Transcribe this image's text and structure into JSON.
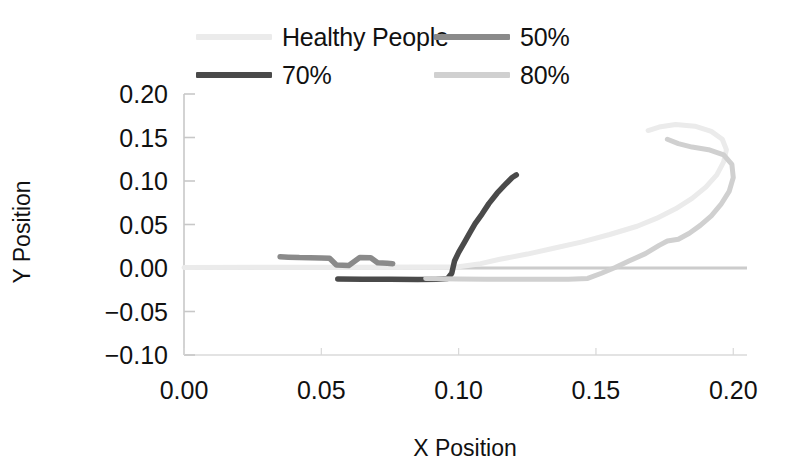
{
  "chart_data": {
    "type": "line",
    "title": "",
    "xlabel": "X Position",
    "ylabel": "Y Position",
    "xlim": [
      0.0,
      0.205
    ],
    "ylim": [
      -0.1,
      0.2
    ],
    "xticks": [
      "0.00",
      "0.05",
      "0.10",
      "0.15",
      "0.20"
    ],
    "xtick_values": [
      0.0,
      0.05,
      0.1,
      0.15,
      0.2
    ],
    "yticks": [
      "0.20",
      "0.15",
      "0.10",
      "0.05",
      "0.00",
      "-0.05",
      "-0.10"
    ],
    "ytick_values": [
      0.2,
      0.15,
      0.1,
      0.05,
      0.0,
      -0.05,
      -0.1
    ],
    "grid": false,
    "legend_position": "top",
    "zero_line": true,
    "series": [
      {
        "name": "Healthy People",
        "color": "#ebebeb",
        "points": [
          [
            0.0,
            0.0005
          ],
          [
            0.03,
            0.0008
          ],
          [
            0.06,
            0.001
          ],
          [
            0.085,
            0.0012
          ],
          [
            0.1,
            0.0015
          ],
          [
            0.108,
            0.005
          ],
          [
            0.115,
            0.01
          ],
          [
            0.125,
            0.016
          ],
          [
            0.135,
            0.023
          ],
          [
            0.145,
            0.03
          ],
          [
            0.155,
            0.0385
          ],
          [
            0.165,
            0.048
          ],
          [
            0.172,
            0.057
          ],
          [
            0.179,
            0.068
          ],
          [
            0.185,
            0.08
          ],
          [
            0.19,
            0.093
          ],
          [
            0.194,
            0.107
          ],
          [
            0.1965,
            0.122
          ],
          [
            0.1975,
            0.136
          ],
          [
            0.196,
            0.148
          ],
          [
            0.192,
            0.157
          ],
          [
            0.186,
            0.163
          ],
          [
            0.179,
            0.165
          ],
          [
            0.173,
            0.162
          ],
          [
            0.169,
            0.158
          ]
        ]
      },
      {
        "name": "50%",
        "color": "#8a8a8a",
        "points": [
          [
            0.035,
            0.013
          ],
          [
            0.038,
            0.0125
          ],
          [
            0.042,
            0.012
          ],
          [
            0.046,
            0.0118
          ],
          [
            0.05,
            0.0115
          ],
          [
            0.053,
            0.0112
          ],
          [
            0.0555,
            0.0035
          ],
          [
            0.06,
            0.003
          ],
          [
            0.064,
            0.012
          ],
          [
            0.068,
            0.0118
          ],
          [
            0.0705,
            0.006
          ],
          [
            0.074,
            0.0055
          ],
          [
            0.076,
            0.005
          ]
        ]
      },
      {
        "name": "70%",
        "color": "#4a4a4a",
        "points": [
          [
            0.056,
            -0.0125
          ],
          [
            0.065,
            -0.0128
          ],
          [
            0.075,
            -0.013
          ],
          [
            0.085,
            -0.0132
          ],
          [
            0.092,
            -0.0128
          ],
          [
            0.096,
            -0.012
          ],
          [
            0.0975,
            -0.006
          ],
          [
            0.098,
            0.001
          ],
          [
            0.0985,
            0.008
          ],
          [
            0.1,
            0.018
          ],
          [
            0.102,
            0.029
          ],
          [
            0.104,
            0.04
          ],
          [
            0.106,
            0.051
          ],
          [
            0.1085,
            0.062
          ],
          [
            0.111,
            0.074
          ],
          [
            0.114,
            0.086
          ],
          [
            0.117,
            0.096
          ],
          [
            0.1195,
            0.104
          ],
          [
            0.121,
            0.107
          ]
        ]
      },
      {
        "name": "80%",
        "color": "#d0d0d0",
        "points": [
          [
            0.088,
            -0.012
          ],
          [
            0.1,
            -0.0125
          ],
          [
            0.11,
            -0.0128
          ],
          [
            0.125,
            -0.013
          ],
          [
            0.14,
            -0.0128
          ],
          [
            0.147,
            -0.012
          ],
          [
            0.152,
            -0.006
          ],
          [
            0.157,
            0.0005
          ],
          [
            0.162,
            0.008
          ],
          [
            0.168,
            0.0165
          ],
          [
            0.173,
            0.026
          ],
          [
            0.176,
            0.031
          ],
          [
            0.18,
            0.033
          ],
          [
            0.184,
            0.04
          ],
          [
            0.188,
            0.049
          ],
          [
            0.192,
            0.06
          ],
          [
            0.1955,
            0.073
          ],
          [
            0.1985,
            0.088
          ],
          [
            0.2,
            0.104
          ],
          [
            0.1995,
            0.119
          ],
          [
            0.1965,
            0.13
          ],
          [
            0.191,
            0.136
          ],
          [
            0.185,
            0.139
          ],
          [
            0.18,
            0.143
          ],
          [
            0.176,
            0.148
          ]
        ]
      }
    ]
  },
  "legend": {
    "entries": [
      {
        "label": "Healthy People",
        "color": "#ebebeb"
      },
      {
        "label": "50%",
        "color": "#8a8a8a"
      },
      {
        "label": "70%",
        "color": "#4a4a4a"
      },
      {
        "label": "80%",
        "color": "#d0d0d0"
      }
    ]
  },
  "axes": {
    "x_title": "X Position",
    "y_title": "Y Position"
  }
}
